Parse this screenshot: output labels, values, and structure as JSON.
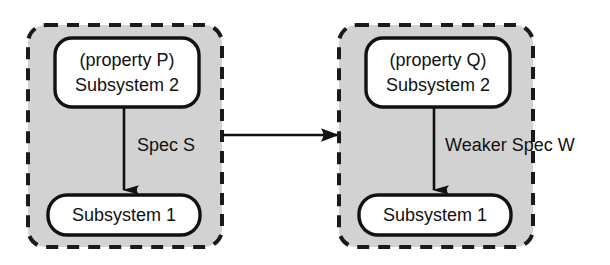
{
  "diagram": {
    "type": "block-diagram",
    "background_color": "#ffffff",
    "group_fill_color": "#d2d2d2",
    "group_border_color": "#1a1a1a",
    "node_fill_color": "#ffffff",
    "node_border_color": "#111111",
    "line_color": "#111111",
    "groups": [
      {
        "id": "left-group",
        "name": "left-subsystem-group",
        "border_style": "dashed",
        "nodes": [
          {
            "id": "left-top-node",
            "name": "property-p-subsystem-2-node",
            "lines": [
              "(property P)",
              "Subsystem 2"
            ]
          },
          {
            "id": "left-bottom-node",
            "name": "subsystem-1-node-left",
            "lines": [
              "Subsystem 1"
            ]
          }
        ],
        "edge": {
          "id": "left-edge",
          "name": "spec-s-edge",
          "label": "Spec S",
          "direction": "down",
          "from": "left-top-node",
          "to": "left-bottom-node"
        }
      },
      {
        "id": "right-group",
        "name": "right-subsystem-group",
        "border_style": "dashed",
        "nodes": [
          {
            "id": "right-top-node",
            "name": "property-q-subsystem-2-node",
            "lines": [
              "(property Q)",
              "Subsystem 2"
            ]
          },
          {
            "id": "right-bottom-node",
            "name": "subsystem-1-node-right",
            "lines": [
              "Subsystem 1"
            ]
          }
        ],
        "edge": {
          "id": "right-edge",
          "name": "weaker-spec-w-edge",
          "label": "Weaker Spec W",
          "direction": "down",
          "from": "right-top-node",
          "to": "right-bottom-node"
        }
      }
    ],
    "connector": {
      "id": "group-connector",
      "name": "left-to-right-group-arrow",
      "label": "",
      "direction": "right",
      "from": "left-group",
      "to": "right-group"
    }
  }
}
